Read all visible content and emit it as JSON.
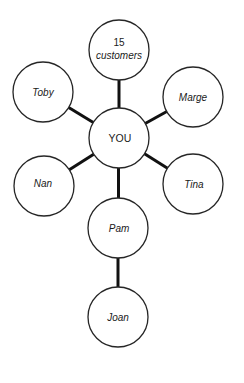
{
  "diagram": {
    "title": "",
    "nodes": {
      "you": "YOU",
      "customers_count": "15",
      "customers_label": "customers",
      "toby": "Toby",
      "marge": "Marge",
      "nan": "Nan",
      "tina": "Tina",
      "pam": "Pam",
      "joan": "Joan"
    },
    "edges": [
      [
        "YOU",
        "15 customers"
      ],
      [
        "YOU",
        "Toby"
      ],
      [
        "YOU",
        "Marge"
      ],
      [
        "YOU",
        "Nan"
      ],
      [
        "YOU",
        "Tina"
      ],
      [
        "YOU",
        "Pam"
      ],
      [
        "Pam",
        "Joan"
      ]
    ],
    "colors": {
      "background": "#ffffff",
      "stroke": "#262626",
      "edge": "#111111",
      "text": "#1a1a1a"
    }
  }
}
